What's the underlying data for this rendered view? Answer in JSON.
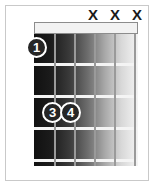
{
  "diagram": {
    "type": "guitar-chord-diagram",
    "strings_count": 6,
    "frets_count": 4,
    "nut_shown": true,
    "colors": {
      "marker_fill": "#262626",
      "marker_text": "#ffffff",
      "fret_wire": "#f4f4f4",
      "string_line": "#9a9a9a",
      "frame": "#c9c9c9",
      "background": "#ffffff",
      "board_dark": "#111111",
      "board_light": "#f4f4f4"
    }
  },
  "muted_strings": [
    {
      "label": "X",
      "x": 86,
      "y": 6
    },
    {
      "label": "X",
      "x": 108,
      "y": 6
    },
    {
      "label": "X",
      "x": 130,
      "y": 6
    }
  ],
  "fingers": [
    {
      "label": "1",
      "string": 1,
      "fret": 1,
      "x": 26,
      "y": 37
    },
    {
      "label": "3",
      "string": 2,
      "fret": 3,
      "x": 42,
      "y": 102
    },
    {
      "label": "4",
      "string": 3,
      "fret": 3,
      "x": 60,
      "y": 102
    }
  ],
  "frets": [
    {
      "y": 29
    },
    {
      "y": 61
    },
    {
      "y": 93
    },
    {
      "y": 125
    }
  ],
  "strings": [
    {
      "x": 20
    },
    {
      "x": 40
    },
    {
      "x": 60
    },
    {
      "x": 80
    },
    {
      "x": 100
    }
  ]
}
